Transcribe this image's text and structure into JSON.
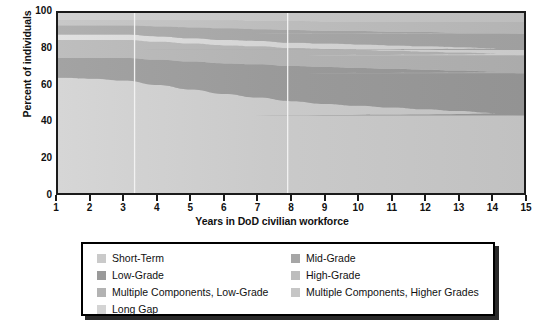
{
  "chart_data": {
    "type": "area",
    "title": "",
    "subtitle": "",
    "xlabel": "Years in DoD civilian workforce",
    "ylabel": "Percent of individuals",
    "xlim": [
      1,
      15
    ],
    "ylim": [
      0,
      100
    ],
    "grid": false,
    "legend_position": "bottom",
    "stacked": true,
    "stack_order": "bottom-to-top",
    "x": [
      1,
      2,
      3,
      4,
      5,
      6,
      7,
      8,
      9,
      10,
      11,
      12,
      13,
      14,
      15
    ],
    "x_tick_labels": [
      "1",
      "2",
      "3",
      "4",
      "5",
      "6",
      "7",
      "8",
      "9",
      "10",
      "11",
      "12",
      "13",
      "14",
      "15"
    ],
    "y_tick_labels": [
      "0",
      "20",
      "40",
      "60",
      "80",
      "100"
    ],
    "y_ticks": [
      0,
      20,
      40,
      60,
      80,
      100
    ],
    "annotations": [
      {
        "type": "vertical-line",
        "x": 3.3,
        "color": "#f2f2f2"
      },
      {
        "type": "vertical-line",
        "x": 7.9,
        "color": "#f2f2f2"
      }
    ],
    "series": [
      {
        "name": "Short-Term",
        "color": "#cacaca",
        "values": [
          64,
          63.5,
          62.5,
          60,
          57.5,
          55,
          53,
          51,
          49.5,
          48.5,
          47.5,
          46.5,
          45.5,
          44.5,
          43
        ]
      },
      {
        "name": "Low-Grade",
        "color": "#9a9a9a",
        "values": [
          11,
          11.5,
          12.5,
          14,
          15.5,
          17,
          18.5,
          19.5,
          20.5,
          21,
          21.5,
          22,
          22.5,
          23,
          23.5
        ]
      },
      {
        "name": "Multiple Components, Low-Grade",
        "color": "#b3b3b3",
        "values": [
          10,
          10,
          10,
          10,
          10,
          10,
          10,
          10,
          10,
          10,
          10,
          10,
          10,
          10,
          10
        ]
      },
      {
        "name": "Long Gap",
        "color": "#d4d4d4",
        "values": [
          3,
          3,
          3,
          3,
          3,
          3,
          3,
          3,
          3,
          3,
          3,
          3,
          3,
          3,
          3
        ]
      },
      {
        "name": "Mid-Grade",
        "color": "#a6a6a6",
        "values": [
          5,
          5,
          5,
          5.5,
          6,
          6.5,
          6.5,
          7,
          7,
          7.5,
          7.5,
          8,
          8,
          8.5,
          9
        ]
      },
      {
        "name": "High-Grade",
        "color": "#bdbdbd",
        "values": [
          3,
          3,
          3,
          3.5,
          4,
          4.5,
          4.5,
          5,
          5,
          5,
          5.5,
          5.5,
          6,
          6,
          6.5
        ]
      },
      {
        "name": "Multiple Components, Higher Grades",
        "color": "#c6c6c6",
        "values": [
          4,
          4,
          4,
          4,
          4,
          4,
          4.5,
          4.5,
          5,
          5,
          5,
          5,
          5,
          5,
          5
        ]
      }
    ]
  },
  "axes": {
    "y_title": "Percent of individuals",
    "x_title": "Years in DoD civilian workforce"
  },
  "legend": {
    "items": [
      {
        "label": "Short-Term",
        "color": "#cacaca",
        "icon": "legend-swatch-icon"
      },
      {
        "label": "Mid-Grade",
        "color": "#a6a6a6",
        "icon": "legend-swatch-icon"
      },
      {
        "label": "Low-Grade",
        "color": "#9a9a9a",
        "icon": "legend-swatch-icon"
      },
      {
        "label": "High-Grade",
        "color": "#bdbdbd",
        "icon": "legend-swatch-icon"
      },
      {
        "label": "Multiple Components, Low-Grade",
        "color": "#b3b3b3",
        "icon": "legend-swatch-icon"
      },
      {
        "label": "Multiple Components, Higher Grades",
        "color": "#c6c6c6",
        "icon": "legend-swatch-icon"
      },
      {
        "label": "Long Gap",
        "color": "#d4d4d4",
        "icon": "legend-swatch-icon"
      }
    ]
  },
  "colors": {
    "axis": "#1b1b1b",
    "text": "#111111",
    "legend_border": "#000000",
    "legend_shadow": "#2a2a2a",
    "reference_line": "#f2f2f2",
    "background": "#ffffff"
  }
}
